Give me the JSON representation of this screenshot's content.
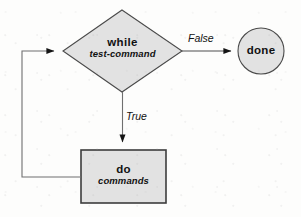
{
  "figure": {
    "background_color": "#fdfdfc"
  },
  "style": {
    "shape_fill": "#e2e2e2",
    "shape_stroke": "#4a4a4a",
    "box_stroke": "#3c3c3c",
    "line_color": "#6b6b6b",
    "arrow_color": "#141414",
    "text_color": "#111111"
  },
  "nodes": {
    "decision": {
      "shape": "diamond",
      "keyword": "while",
      "argument": "test-command",
      "points": "122,10 182,51 122,92 63,51"
    },
    "terminal": {
      "shape": "circle",
      "keyword": "done",
      "cx": 261,
      "cy": 51,
      "r": 23
    },
    "process": {
      "shape": "rectangle",
      "keyword": "do",
      "argument": "commands",
      "x": 81,
      "y": 150,
      "width": 85,
      "height": 53
    }
  },
  "edges": {
    "false_branch": {
      "label": "False",
      "path": "M 182 51 L 232 51",
      "arrow_at": "circle-left"
    },
    "true_branch": {
      "label": "True",
      "path": "M 122 92 L 122 143",
      "arrow_at": "process-top"
    },
    "loop_back": {
      "label": "",
      "path": "M 81 177 L 22 177 L 22 51 L 55 51",
      "arrow_at": "diamond-left"
    }
  }
}
